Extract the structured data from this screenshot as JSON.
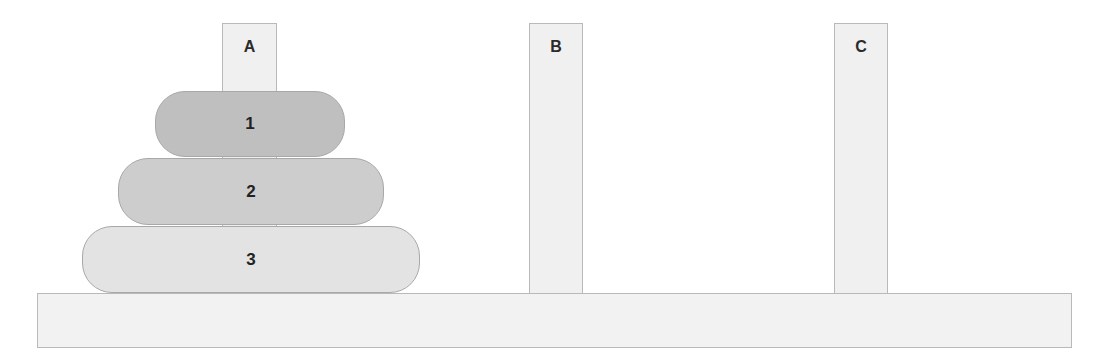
{
  "diagram": {
    "pegs": [
      {
        "label": "A",
        "x": 222,
        "width": 55
      },
      {
        "label": "B",
        "x": 529,
        "width": 54
      },
      {
        "label": "C",
        "x": 834,
        "width": 54
      }
    ],
    "discs": [
      {
        "label": "1",
        "peg": "A",
        "x": 155,
        "y": 91,
        "width": 190,
        "height": 66,
        "color": "#bfbfbf"
      },
      {
        "label": "2",
        "peg": "A",
        "x": 118,
        "y": 158,
        "width": 266,
        "height": 67,
        "color": "#cdcdcd"
      },
      {
        "label": "3",
        "peg": "A",
        "x": 82,
        "y": 226,
        "width": 338,
        "height": 67,
        "color": "#e3e3e3"
      }
    ],
    "colors": {
      "peg": "#f0f0f0",
      "base": "#f2f2f2",
      "border": "#b9b9b9"
    }
  }
}
